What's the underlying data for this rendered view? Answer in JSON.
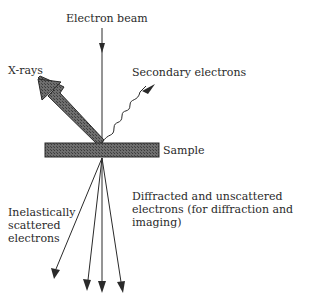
{
  "diagram": {
    "labels": {
      "electron_beam": "Electron beam",
      "xrays": "X-rays",
      "secondary_electrons": "Secondary electrons",
      "sample": "Sample",
      "inelastic": [
        "Inelastically",
        "scattered",
        "electrons"
      ],
      "diffracted": [
        "Diffracted and unscattered",
        "electrons (for diffraction and imaging)"
      ]
    },
    "colors": {
      "line": "#2a2a2a",
      "sample_fill": "#5a5a5a",
      "xray_fill": "#6a6a6a"
    }
  }
}
